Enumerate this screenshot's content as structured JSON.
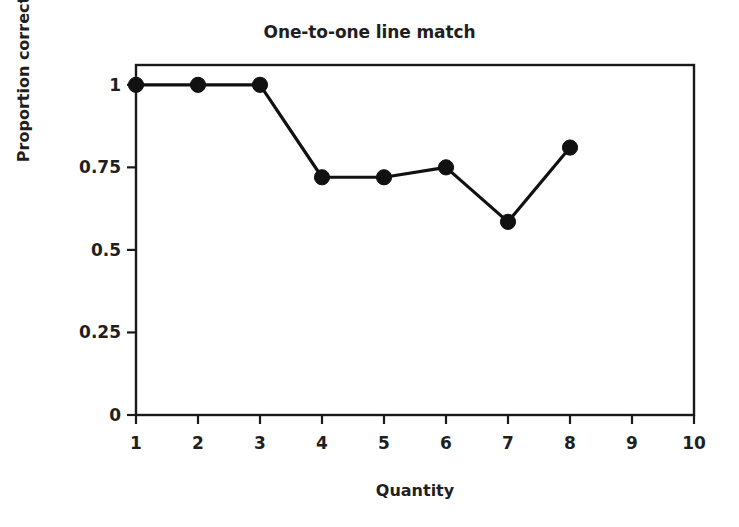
{
  "chart_data": {
    "type": "line",
    "title": "One-to-one line match",
    "xlabel": "Quantity",
    "ylabel": "Proportion correct",
    "x": [
      1,
      2,
      3,
      4,
      5,
      6,
      7,
      8
    ],
    "values": [
      1,
      1,
      1,
      0.72,
      0.72,
      0.75,
      0.585,
      0.81
    ],
    "xlim": [
      1,
      10
    ],
    "ylim": [
      0,
      1.06
    ],
    "xticks": [
      1,
      2,
      3,
      4,
      5,
      6,
      7,
      8,
      9,
      10
    ],
    "xtick_labels": [
      "1",
      "2",
      "3",
      "4",
      "5",
      "6",
      "7",
      "8",
      "9",
      "10"
    ],
    "yticks": [
      0,
      0.25,
      0.5,
      0.75,
      1
    ],
    "ytick_labels": [
      "0",
      "0.25",
      "0.5",
      "0.75",
      "1"
    ],
    "grid": false,
    "legend": false,
    "marker": "filled-circle",
    "line_color": "#111111",
    "marker_color": "#111111",
    "axis_color": "#1a1a1a",
    "background": "#ffffff"
  },
  "figure": {
    "title": "One-to-one line match",
    "x_axis_title": "Quantity",
    "y_axis_title": "Proportion correct"
  }
}
